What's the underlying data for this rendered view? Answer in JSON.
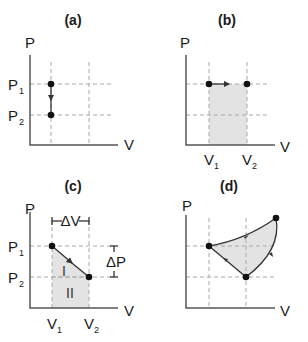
{
  "figure": {
    "panels": [
      {
        "id": "a",
        "title": "(a)",
        "y_axis_label": "P",
        "x_axis_label": "V",
        "y_ticks": [
          {
            "main": "P",
            "sub": "1"
          },
          {
            "main": "P",
            "sub": "2"
          }
        ],
        "x_ticks": [],
        "process": "isochoric: pressure drops from P1 to P2 at constant volume"
      },
      {
        "id": "b",
        "title": "(b)",
        "y_axis_label": "P",
        "x_axis_label": "V",
        "y_ticks": [],
        "x_ticks": [
          {
            "main": "V",
            "sub": "1"
          },
          {
            "main": "V",
            "sub": "2"
          }
        ],
        "process": "isobaric: volume expands from V1 to V2 at constant pressure; work area shaded"
      },
      {
        "id": "c",
        "title": "(c)",
        "y_axis_label": "P",
        "x_axis_label": "V",
        "y_ticks": [
          {
            "main": "P",
            "sub": "1"
          },
          {
            "main": "P",
            "sub": "2"
          }
        ],
        "x_ticks": [
          {
            "main": "V",
            "sub": "1"
          },
          {
            "main": "V",
            "sub": "2"
          }
        ],
        "delta_v_label": "ΔV",
        "delta_p_label": "ΔP",
        "region_labels": [
          "I",
          "II"
        ],
        "process": "linear path from (V1,P1) to (V2,P2); area split into triangle I and rectangle II"
      },
      {
        "id": "d",
        "title": "(d)",
        "y_axis_label": "P",
        "x_axis_label": "V",
        "y_ticks": [],
        "x_ticks": [],
        "process": "closed cycle through three points; enclosed area shaded"
      }
    ]
  },
  "colors": {
    "shade": "#e3e3e3",
    "axis": "#555555",
    "gridline": "#aaaaaa",
    "point": "#111111"
  }
}
